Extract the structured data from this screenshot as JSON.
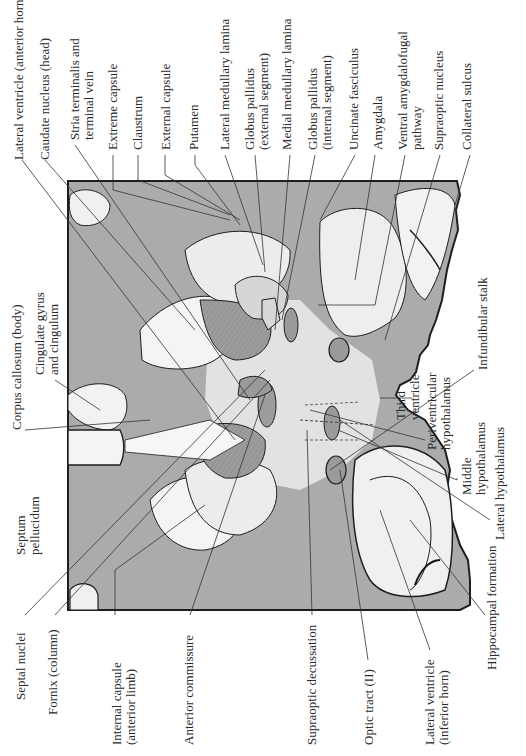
{
  "figure": {
    "colors": {
      "background": "#ffffff",
      "white_matter_gray": "#a9a9a9",
      "light_tissue": "#e6e6e6",
      "nuclei_fill": "#9a9a9a",
      "outline": "#1e1e1e",
      "leader_line": "#333333"
    }
  },
  "labels_top": [
    {
      "id": "lateral-ventricle-anterior-horn",
      "text": "Lateral ventricle (anterior horn)"
    },
    {
      "id": "caudate-nucleus-head",
      "text": "Caudate nucleus (head)"
    },
    {
      "id": "stria-terminalis",
      "text": "Stria terminalis and\nterminal vein"
    },
    {
      "id": "extreme-capsule",
      "text": "Extreme capsule"
    },
    {
      "id": "claustrum",
      "text": "Claustrum"
    },
    {
      "id": "external-capsule",
      "text": "External capsule"
    },
    {
      "id": "putamen",
      "text": "Putamen"
    },
    {
      "id": "lateral-medullary-lamina",
      "text": "Lateral medullary lamina"
    },
    {
      "id": "globus-pallidus-external",
      "text": "Globus pallidus\n(external segment)"
    },
    {
      "id": "medial-medullary-lamina",
      "text": "Medial medullary lamina"
    },
    {
      "id": "globus-pallidus-internal",
      "text": "Globus pallidus\n(internal segment)"
    },
    {
      "id": "uncinate-fasciculus",
      "text": "Uncinate fasciculus"
    },
    {
      "id": "amygdala",
      "text": "Amygdala"
    },
    {
      "id": "ventral-amygdalofugal-pathway",
      "text": "Ventral amygdalofugal\npathway"
    },
    {
      "id": "supraoptic-nucleus",
      "text": "Supraoptic nucleus"
    },
    {
      "id": "collateral-sulcus",
      "text": "Collateral sulcus"
    }
  ],
  "labels_left": [
    {
      "id": "corpus-callosum-body",
      "text": "Corpus callosum (body)"
    },
    {
      "id": "cingulate-gyrus",
      "text": "Cingulate gyrus\nand cingulum"
    },
    {
      "id": "septum-pellucidum",
      "text": "Septum\npellucidum"
    }
  ],
  "labels_right": [
    {
      "id": "infundibular-stalk",
      "text": "Infundibular stalk"
    },
    {
      "id": "third-ventricle",
      "text": "Third\nventricle"
    },
    {
      "id": "periventricular-hypothalamus",
      "text": "Periventricular\nhypothalamus"
    },
    {
      "id": "middle-hypothalamus",
      "text": "Middle\nhypothalamus"
    },
    {
      "id": "lateral-hypothalamus",
      "text": "Lateral hypothalamus"
    }
  ],
  "labels_bottom": [
    {
      "id": "septal-nuclei",
      "text": "Septal nuclei"
    },
    {
      "id": "fornix-column",
      "text": "Fornix (column)"
    },
    {
      "id": "internal-capsule-anterior-limb",
      "text": "Internal capsule\n(anterior limb)"
    },
    {
      "id": "anterior-commissure",
      "text": "Anterior commissure"
    },
    {
      "id": "supraoptic-decussation",
      "text": "Supraoptic decussation"
    },
    {
      "id": "optic-tract",
      "text": "Optic tract (II)"
    },
    {
      "id": "lateral-ventricle-inferior-horn",
      "text": "Lateral ventricle\n(inferior horn)"
    },
    {
      "id": "hippocampal-formation",
      "text": "Hippocampal formation"
    }
  ]
}
